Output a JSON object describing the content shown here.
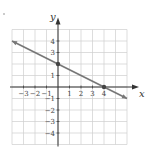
{
  "chart_data": {
    "type": "line",
    "title": "",
    "xlabel": "x",
    "ylabel": "y",
    "xlim": [
      -4,
      6
    ],
    "ylim": [
      -5,
      5
    ],
    "grid": true,
    "x_ticks": [
      -3,
      -2,
      -1,
      1,
      2,
      3,
      4
    ],
    "y_ticks": [
      4,
      3,
      1,
      -1,
      -2,
      -3,
      -4
    ],
    "series": [
      {
        "name": "line",
        "equation": "y = -x/2 + 2",
        "x": [
          -4,
          6
        ],
        "y": [
          4,
          -1
        ],
        "color": "#777777"
      }
    ],
    "points": [
      {
        "x": 0,
        "y": 2,
        "label": "y-intercept"
      },
      {
        "x": 4,
        "y": 0,
        "label": "x-intercept"
      }
    ]
  },
  "labels": {
    "x_axis": "x",
    "y_axis": "y"
  },
  "colors": {
    "grid": "#cfcfcf",
    "axis": "#333333",
    "line": "#777777",
    "point": "#444444"
  }
}
